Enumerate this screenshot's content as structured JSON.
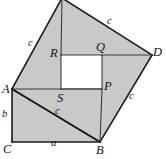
{
  "figure": {
    "kind": "geometry-diagram",
    "canvas": {
      "width": 166,
      "height": 159
    },
    "colors": {
      "shaded_fill": "#c9c9c9",
      "hole_fill": "#ffffff",
      "stroke": "#1a1a1a",
      "background": "#ffffff",
      "label_color": "#111111"
    },
    "vertex_labels": [
      {
        "id": "A",
        "text": "A",
        "x": 2,
        "y": 83
      },
      {
        "id": "B",
        "text": "B",
        "x": 96,
        "y": 144
      },
      {
        "id": "C",
        "text": "C",
        "x": 3,
        "y": 143
      },
      {
        "id": "D",
        "text": "D",
        "x": 153,
        "y": 46
      },
      {
        "id": "P",
        "text": "P",
        "x": 104,
        "y": 80
      },
      {
        "id": "Q",
        "text": "Q",
        "x": 96,
        "y": 41
      },
      {
        "id": "R",
        "text": "R",
        "x": 50,
        "y": 47
      },
      {
        "id": "S",
        "text": "S",
        "x": 57,
        "y": 92
      }
    ],
    "side_labels": [
      {
        "id": "c-left",
        "text": "c",
        "x": 28,
        "y": 38
      },
      {
        "id": "c-top",
        "text": "c",
        "x": 107,
        "y": 16
      },
      {
        "id": "c-right",
        "text": "c",
        "x": 129,
        "y": 91
      },
      {
        "id": "c-diagonal",
        "text": "c",
        "x": 55,
        "y": 106
      },
      {
        "id": "a-bottom",
        "text": "a",
        "x": 51,
        "y": 138
      },
      {
        "id": "b-left",
        "text": "b",
        "x": 2,
        "y": 109
      }
    ],
    "points": {
      "A": [
        12,
        89
      ],
      "B": [
        100,
        142
      ],
      "C": [
        12,
        142
      ],
      "D": [
        152,
        55
      ],
      "P": [
        102,
        89
      ],
      "Q": [
        102,
        55
      ],
      "R": [
        61,
        55
      ],
      "S": [
        61,
        89
      ],
      "T": [
        62,
        -2
      ]
    },
    "geometry_notes": {
      "outer_square": "A-T-D-B is the large tilted square of side c",
      "inner_square": "R-Q-P-S is the white square hole (b - a)",
      "rectangle": "A-S-...-C-B lower rectangle with legs a and b",
      "legs": {
        "a": "C to B (horizontal)",
        "b": "A to C (vertical)"
      },
      "hypotenuse": "c"
    }
  }
}
